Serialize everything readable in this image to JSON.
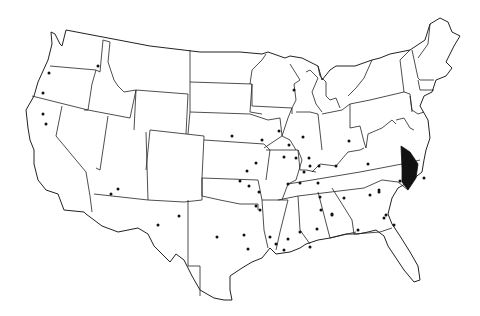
{
  "map": {
    "type": "us-states-outline",
    "background": "#ffffff",
    "line_color": "#222222",
    "dot_color": "#111111",
    "highlight_color": "#111111",
    "highlighted_region": "central-virginia",
    "dots": [
      {
        "x": 49,
        "y": 73
      },
      {
        "x": 43,
        "y": 93
      },
      {
        "x": 43,
        "y": 114
      },
      {
        "x": 46,
        "y": 124
      },
      {
        "x": 98,
        "y": 66
      },
      {
        "x": 232,
        "y": 136
      },
      {
        "x": 118,
        "y": 189
      },
      {
        "x": 111,
        "y": 194
      },
      {
        "x": 179,
        "y": 216
      },
      {
        "x": 158,
        "y": 225
      },
      {
        "x": 217,
        "y": 237
      },
      {
        "x": 294,
        "y": 90
      },
      {
        "x": 279,
        "y": 131
      },
      {
        "x": 289,
        "y": 145
      },
      {
        "x": 284,
        "y": 157
      },
      {
        "x": 256,
        "y": 163
      },
      {
        "x": 249,
        "y": 186
      },
      {
        "x": 259,
        "y": 192
      },
      {
        "x": 240,
        "y": 181
      },
      {
        "x": 309,
        "y": 158
      },
      {
        "x": 310,
        "y": 166
      },
      {
        "x": 304,
        "y": 172
      },
      {
        "x": 296,
        "y": 158
      },
      {
        "x": 319,
        "y": 166
      },
      {
        "x": 288,
        "y": 184
      },
      {
        "x": 300,
        "y": 183
      },
      {
        "x": 318,
        "y": 183
      },
      {
        "x": 303,
        "y": 137
      },
      {
        "x": 336,
        "y": 166
      },
      {
        "x": 349,
        "y": 141
      },
      {
        "x": 320,
        "y": 197
      },
      {
        "x": 321,
        "y": 210
      },
      {
        "x": 332,
        "y": 215
      },
      {
        "x": 344,
        "y": 198
      },
      {
        "x": 300,
        "y": 232
      },
      {
        "x": 332,
        "y": 214
      },
      {
        "x": 317,
        "y": 229
      },
      {
        "x": 310,
        "y": 247
      },
      {
        "x": 276,
        "y": 244
      },
      {
        "x": 288,
        "y": 239
      },
      {
        "x": 248,
        "y": 249
      },
      {
        "x": 244,
        "y": 235
      },
      {
        "x": 270,
        "y": 237
      },
      {
        "x": 260,
        "y": 210
      },
      {
        "x": 256,
        "y": 206
      },
      {
        "x": 284,
        "y": 250
      },
      {
        "x": 368,
        "y": 164
      },
      {
        "x": 370,
        "y": 195
      },
      {
        "x": 379,
        "y": 192
      },
      {
        "x": 400,
        "y": 181
      },
      {
        "x": 386,
        "y": 215
      },
      {
        "x": 384,
        "y": 218
      },
      {
        "x": 358,
        "y": 230
      },
      {
        "x": 394,
        "y": 225
      },
      {
        "x": 424,
        "y": 178
      },
      {
        "x": 379,
        "y": 190
      },
      {
        "x": 262,
        "y": 140
      },
      {
        "x": 247,
        "y": 171
      }
    ]
  }
}
